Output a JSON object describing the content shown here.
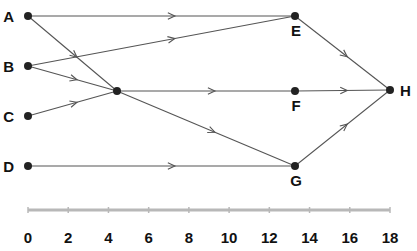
{
  "diagram": {
    "type": "network / activity graph on time axis",
    "nodes": [
      {
        "id": "A",
        "label": "A",
        "x": 28,
        "y": 16,
        "label_pos": "left"
      },
      {
        "id": "B",
        "label": "B",
        "x": 28,
        "y": 66,
        "label_pos": "left"
      },
      {
        "id": "C",
        "label": "C",
        "x": 28,
        "y": 116,
        "label_pos": "left"
      },
      {
        "id": "D",
        "label": "D",
        "x": 28,
        "y": 166,
        "label_pos": "left"
      },
      {
        "id": "X",
        "label": "",
        "x": 117,
        "y": 91,
        "label_pos": "none"
      },
      {
        "id": "E",
        "label": "E",
        "x": 295,
        "y": 16,
        "label_pos": "below"
      },
      {
        "id": "F",
        "label": "F",
        "x": 295,
        "y": 91,
        "label_pos": "below"
      },
      {
        "id": "G",
        "label": "G",
        "x": 295,
        "y": 166,
        "label_pos": "below"
      },
      {
        "id": "H",
        "label": "H",
        "x": 390,
        "y": 90,
        "label_pos": "right"
      }
    ],
    "edges": [
      {
        "from": "A",
        "to": "E"
      },
      {
        "from": "A",
        "to": "X"
      },
      {
        "from": "B",
        "to": "E"
      },
      {
        "from": "B",
        "to": "X"
      },
      {
        "from": "C",
        "to": "X"
      },
      {
        "from": "X",
        "to": "F"
      },
      {
        "from": "X",
        "to": "G"
      },
      {
        "from": "D",
        "to": "G"
      },
      {
        "from": "E",
        "to": "H"
      },
      {
        "from": "F",
        "to": "H"
      },
      {
        "from": "G",
        "to": "H"
      }
    ]
  },
  "axis": {
    "y": 210,
    "x_start": 28,
    "x_end": 390,
    "min": 0,
    "max": 18,
    "ticks": [
      "0",
      "2",
      "4",
      "6",
      "8",
      "10",
      "12",
      "14",
      "16",
      "18"
    ]
  }
}
